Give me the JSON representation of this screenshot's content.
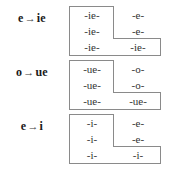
{
  "diagram": {
    "border_color": "#8a8a8a",
    "text_color": "#333333",
    "label_color": "#1a1a1a",
    "background": "#ffffff",
    "arrow_glyph": "→",
    "groups": [
      {
        "id": "e-to-ie",
        "rule": {
          "from": "e",
          "arrow": "→",
          "to": "ie",
          "full": "e → ie"
        },
        "cells": {
          "r1c1": "-ie-",
          "r1c2": "-e-",
          "r2c1": "-ie-",
          "r2c2": "-e-",
          "r3c1": "-ie-",
          "r3c2": "-ie-"
        }
      },
      {
        "id": "o-to-ue",
        "rule": {
          "from": "o",
          "arrow": "→",
          "to": "ue",
          "full": "o → ue"
        },
        "cells": {
          "r1c1": "-ue-",
          "r1c2": "-o-",
          "r2c1": "-ue-",
          "r2c2": "-o-",
          "r3c1": "-ue-",
          "r3c2": "-ue-"
        }
      },
      {
        "id": "e-to-i",
        "rule": {
          "from": "e",
          "arrow": "→",
          "to": "i",
          "full": "e → i"
        },
        "cells": {
          "r1c1": "-i-",
          "r1c2": "-e-",
          "r2c1": "-i-",
          "r2c2": "-e-",
          "r3c1": "-i-",
          "r3c2": "-i-"
        }
      }
    ]
  }
}
